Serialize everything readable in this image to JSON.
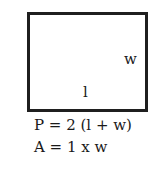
{
  "diagram": {
    "shape": "rectangle",
    "labels": {
      "width": "w",
      "length": "l"
    },
    "formulas": {
      "perimeter": "P = 2 (l + w)",
      "area": "A = 1 x w"
    },
    "colors": {
      "stroke": "#1f1f1f",
      "background": "#ffffff"
    }
  }
}
